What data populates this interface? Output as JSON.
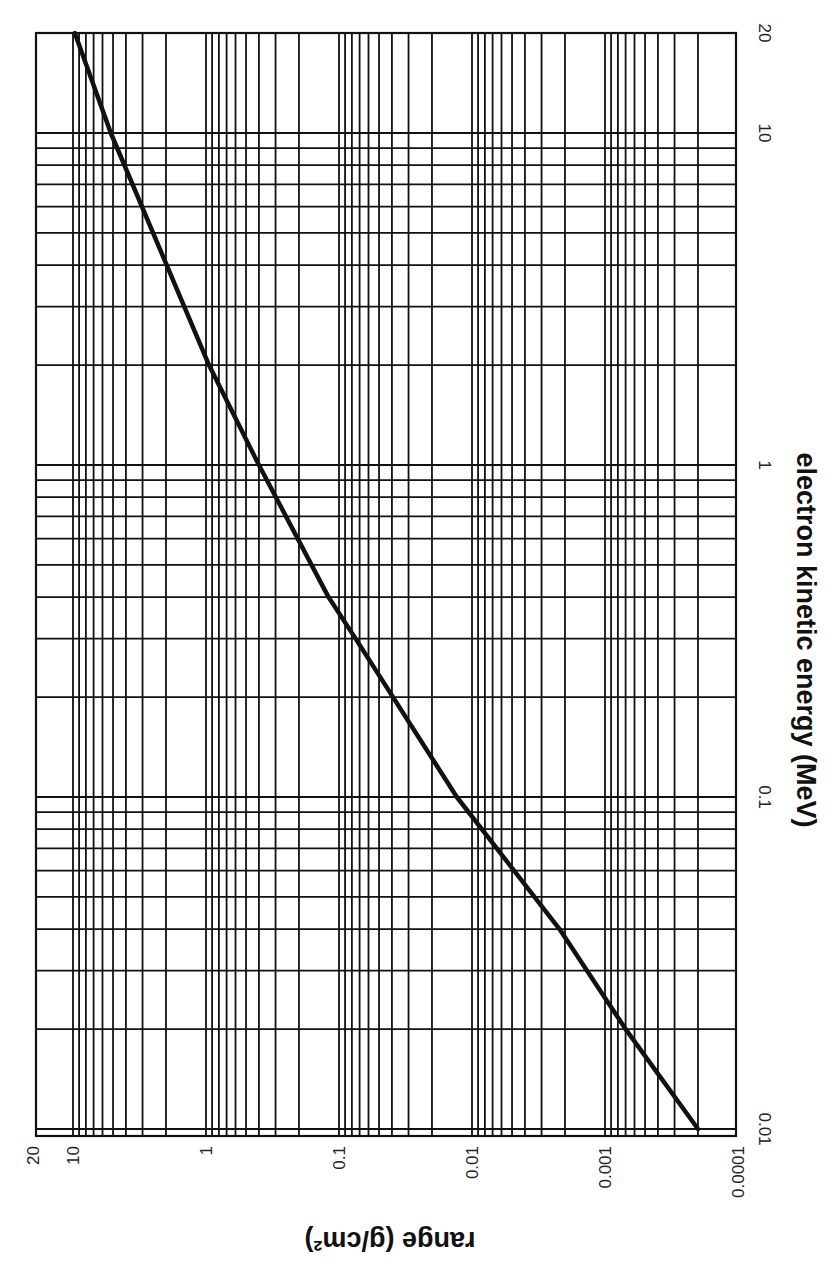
{
  "chart_data": {
    "type": "line",
    "title": "",
    "xlabel": "electron kinetic energy (MeV)",
    "ylabel": "range (g/cm²)",
    "x_scale": "log",
    "y_scale": "log",
    "xlim": [
      0.01,
      20
    ],
    "ylim": [
      0.0001,
      20
    ],
    "grid": true,
    "orientation_note": "figure rotated 90° clockwise: energy axis runs vertically along the right side (20 at top, 0.01 at bottom); range axis runs horizontally along the bottom (20 at left, 0.0001 at right)",
    "x_ticks": [
      {
        "value": 0.01,
        "label": "0.01"
      },
      {
        "value": 0.1,
        "label": "0.1"
      },
      {
        "value": 1,
        "label": "1"
      },
      {
        "value": 10,
        "label": "10"
      },
      {
        "value": 20,
        "label": "20"
      }
    ],
    "y_ticks": [
      {
        "value": 0.0001,
        "label": "0.0001"
      },
      {
        "value": 0.001,
        "label": "0.001"
      },
      {
        "value": 0.01,
        "label": "0.01"
      },
      {
        "value": 0.1,
        "label": "0.1"
      },
      {
        "value": 1,
        "label": "1"
      },
      {
        "value": 10,
        "label": "10"
      },
      {
        "value": 20,
        "label": "20"
      }
    ],
    "series": [
      {
        "name": "electron range",
        "x": [
          0.01,
          0.02,
          0.04,
          0.1,
          0.3,
          0.4,
          1,
          2,
          10,
          20
        ],
        "values": [
          0.0002,
          0.0007,
          0.0022,
          0.013,
          0.075,
          0.12,
          0.4,
          0.95,
          5.2,
          9.7
        ]
      }
    ],
    "colors": {
      "curve": "#111111",
      "grid": "#111111",
      "background": "#ffffff"
    }
  }
}
